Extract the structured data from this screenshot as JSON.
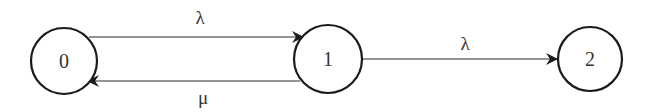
{
  "diagram": {
    "type": "state-transition",
    "colors": {
      "stroke": "#1a1a1a",
      "text": "#333333",
      "background": "#ffffff"
    },
    "nodes": [
      {
        "id": "0",
        "label": "0",
        "cx": 64,
        "cy": 61,
        "r": 33
      },
      {
        "id": "1",
        "label": "1",
        "cx": 328,
        "cy": 59,
        "r": 34
      },
      {
        "id": "2",
        "label": "2",
        "cx": 590,
        "cy": 59,
        "r": 32
      }
    ],
    "edges": [
      {
        "from": "0",
        "to": "1",
        "label": "λ"
      },
      {
        "from": "1",
        "to": "0",
        "label": "μ"
      },
      {
        "from": "1",
        "to": "2",
        "label": "λ"
      }
    ]
  }
}
